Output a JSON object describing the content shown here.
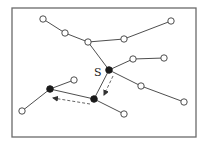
{
  "diagram": {
    "type": "tree-graph",
    "frame": {
      "x": 12,
      "y": 8,
      "w": 184,
      "h": 129
    },
    "nodes": [
      {
        "id": "n1",
        "x": 43,
        "y": 19,
        "filled": false
      },
      {
        "id": "n2",
        "x": 65,
        "y": 33,
        "filled": false
      },
      {
        "id": "n3",
        "x": 88,
        "y": 42,
        "filled": false
      },
      {
        "id": "n4",
        "x": 124,
        "y": 39,
        "filled": false
      },
      {
        "id": "n5",
        "x": 171,
        "y": 21,
        "filled": false
      },
      {
        "id": "n6",
        "x": 133,
        "y": 59,
        "filled": false
      },
      {
        "id": "n7",
        "x": 164,
        "y": 58,
        "filled": false
      },
      {
        "id": "S",
        "x": 109,
        "y": 70,
        "filled": true,
        "label": "S"
      },
      {
        "id": "n9",
        "x": 141,
        "y": 86,
        "filled": false
      },
      {
        "id": "n10",
        "x": 184,
        "y": 102,
        "filled": false
      },
      {
        "id": "n11",
        "x": 94,
        "y": 99,
        "filled": true
      },
      {
        "id": "n12",
        "x": 124,
        "y": 114,
        "filled": false
      },
      {
        "id": "n13",
        "x": 50,
        "y": 89,
        "filled": true
      },
      {
        "id": "n14",
        "x": 74,
        "y": 80,
        "filled": false
      },
      {
        "id": "n15",
        "x": 22,
        "y": 111,
        "filled": false
      }
    ],
    "edges": [
      [
        "n1",
        "n2"
      ],
      [
        "n2",
        "n3"
      ],
      [
        "n3",
        "n4"
      ],
      [
        "n4",
        "n5"
      ],
      [
        "n3",
        "S"
      ],
      [
        "S",
        "n6"
      ],
      [
        "n6",
        "n7"
      ],
      [
        "S",
        "n9"
      ],
      [
        "n9",
        "n10"
      ],
      [
        "S",
        "n11"
      ],
      [
        "n11",
        "n12"
      ],
      [
        "n11",
        "n13"
      ],
      [
        "n13",
        "n14"
      ],
      [
        "n13",
        "n15"
      ]
    ],
    "dashed_arrows": [
      {
        "from": [
          113,
          76
        ],
        "to": [
          104,
          95
        ]
      },
      {
        "from": [
          90,
          104
        ],
        "to": [
          53,
          98
        ]
      }
    ],
    "labels": {
      "source": "S"
    }
  }
}
